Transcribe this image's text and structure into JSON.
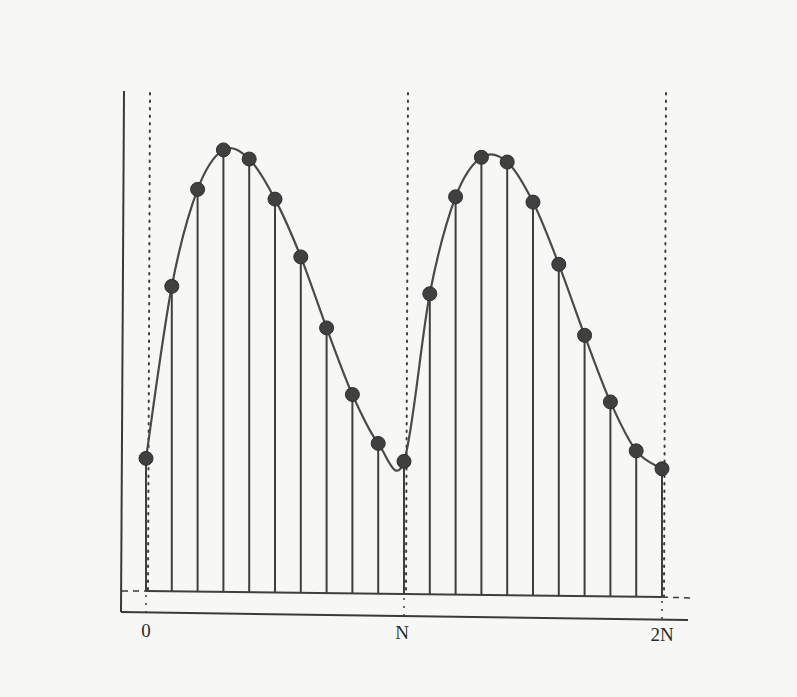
{
  "chart_data": {
    "type": "stem",
    "title": "",
    "xlabel": "",
    "ylabel": "",
    "x_tick_labels": [
      {
        "n": 0,
        "label": "0"
      },
      {
        "n": 10,
        "label": "N"
      },
      {
        "n": 20,
        "label": "2N"
      }
    ],
    "period_samples": 10,
    "n": [
      0,
      1,
      2,
      3,
      4,
      5,
      6,
      7,
      8,
      9,
      10,
      11,
      12,
      13,
      14,
      15,
      16,
      17,
      18,
      19,
      20
    ],
    "values": [
      0.3,
      0.69,
      0.91,
      1.0,
      0.98,
      0.89,
      0.76,
      0.6,
      0.45,
      0.34,
      0.3,
      0.68,
      0.9,
      0.99,
      0.98,
      0.89,
      0.75,
      0.59,
      0.44,
      0.33,
      0.29
    ],
    "ylim": [
      0,
      1.1
    ],
    "grid": false,
    "legend": null,
    "period_markers": [
      "0",
      "N",
      "2N"
    ],
    "colors": {
      "ink": "#3f3f3f",
      "background": "#f7f7f5"
    }
  },
  "axis": {
    "labels": {
      "zero": "0",
      "period": "N",
      "double_period": "2N"
    }
  }
}
